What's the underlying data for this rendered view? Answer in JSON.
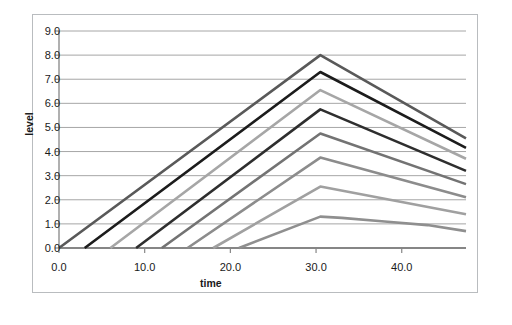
{
  "chart_data": {
    "type": "line",
    "title": "",
    "xlabel": "time",
    "ylabel": "level",
    "xlim": [
      0.0,
      47.5
    ],
    "ylim": [
      0.0,
      9.0
    ],
    "xticks": [
      "0.0",
      "10.0",
      "20.0",
      "30.0",
      "40.0"
    ],
    "xtick_values": [
      0,
      10,
      20,
      30,
      40
    ],
    "yticks": [
      "0.0",
      "1.0",
      "2.0",
      "3.0",
      "4.0",
      "5.0",
      "6.0",
      "7.0",
      "8.0",
      "9.0"
    ],
    "ytick_values": [
      0,
      1,
      2,
      3,
      4,
      5,
      6,
      7,
      8,
      9
    ],
    "grid": "horizontal",
    "legend": "none",
    "series": [
      {
        "name": "series-1",
        "color": "#595959",
        "x": [
          0.0,
          30.5,
          47.5
        ],
        "y": [
          0.0,
          8.0,
          4.55
        ]
      },
      {
        "name": "series-2",
        "color": "#1c1c1c",
        "x": [
          3.0,
          30.5,
          47.5
        ],
        "y": [
          0.0,
          7.3,
          4.15
        ]
      },
      {
        "name": "series-3",
        "color": "#a6a6a6",
        "x": [
          6.0,
          30.5,
          47.5
        ],
        "y": [
          0.0,
          6.55,
          3.7
        ]
      },
      {
        "name": "series-4",
        "color": "#2e2e2e",
        "x": [
          9.0,
          30.5,
          47.5
        ],
        "y": [
          0.0,
          5.75,
          3.2
        ]
      },
      {
        "name": "series-5",
        "color": "#737373",
        "x": [
          12.0,
          30.5,
          47.5
        ],
        "y": [
          0.0,
          4.75,
          2.65
        ]
      },
      {
        "name": "series-6",
        "color": "#8c8c8c",
        "x": [
          15.0,
          30.5,
          47.5
        ],
        "y": [
          0.0,
          3.75,
          2.1
        ]
      },
      {
        "name": "series-7",
        "color": "#a0a0a0",
        "x": [
          18.0,
          30.5,
          47.5
        ],
        "y": [
          0.0,
          2.55,
          1.4
        ]
      },
      {
        "name": "series-8",
        "color": "#8f8f8f",
        "x": [
          21.0,
          30.5,
          33.0,
          38.0,
          43.0,
          47.5
        ],
        "y": [
          0.0,
          1.3,
          1.25,
          1.1,
          0.95,
          0.7
        ]
      }
    ]
  },
  "axis_style": {
    "gridline_color": "#a6a6a6",
    "axis_color": "#868686",
    "frame_color": "#b9bcbf",
    "tick_text_color": "#1a1a1a",
    "background": "#ffffff",
    "line_width": 2.6
  }
}
